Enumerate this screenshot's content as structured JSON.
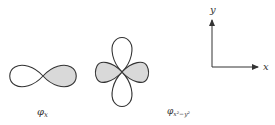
{
  "orbitals": [
    {
      "name": "p_x",
      "label_main": "φ",
      "label_sub": "x"
    },
    {
      "name": "d_x2-y2",
      "label_main": "φ",
      "label_sub": "x²−y²"
    }
  ],
  "axes": {
    "x_label": "x",
    "y_label": "y"
  },
  "colors": {
    "stroke": "#333333",
    "fill_shaded": "#d9d9d9",
    "fill_unshaded": "#ffffff"
  }
}
